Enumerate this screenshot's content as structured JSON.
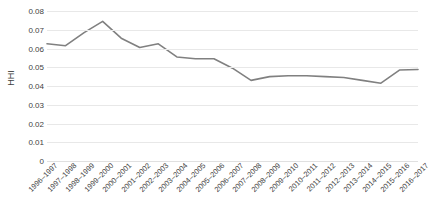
{
  "chart_data": {
    "type": "line",
    "title": "",
    "subtitle": "",
    "xlabel": "",
    "ylabel": "HHI",
    "ylim": [
      0,
      0.08
    ],
    "y_ticks": [
      "0",
      "0.01",
      "0.02",
      "0.03",
      "0.04",
      "0.05",
      "0.06",
      "0.07",
      "0.08"
    ],
    "y_tick_values": [
      0,
      0.01,
      0.02,
      0.03,
      0.04,
      0.05,
      0.06,
      0.07,
      0.08
    ],
    "grid": true,
    "legend": "none",
    "series_color": "#808080",
    "categories": [
      "1996–1997",
      "1997–1998",
      "1998–1999",
      "1999–2000",
      "2000–2001",
      "2001–2002",
      "2002–2003",
      "2003–2004",
      "2004–2005",
      "2005–2006",
      "2006–2007",
      "2007–2008",
      "2008–2009",
      "2009–2010",
      "2010–2011",
      "2011–2012",
      "2012–2013",
      "2013–2014",
      "2014–2015",
      "2015–2016",
      "2016–2017"
    ],
    "values": [
      0.0625,
      0.0615,
      0.0685,
      0.0745,
      0.0655,
      0.0605,
      0.0625,
      0.0555,
      0.0545,
      0.0545,
      0.0495,
      0.043,
      0.045,
      0.0455,
      0.0455,
      0.045,
      0.0445,
      0.043,
      0.0415,
      0.0485,
      0.0488
    ]
  }
}
